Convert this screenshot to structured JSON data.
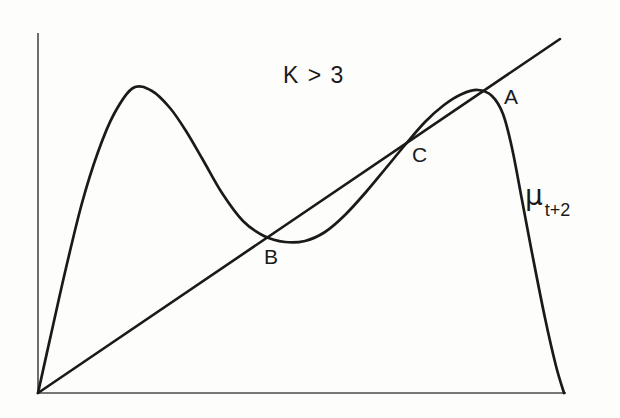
{
  "figure": {
    "background_color": "#fdfdfb",
    "ink_color": "#1a1a1a",
    "annotations": {
      "condition_label": "K > 3",
      "curve_label_symbol": "μ",
      "curve_label_subscript": "t+2",
      "point_a": "A",
      "point_b": "B",
      "point_c": "C"
    }
  },
  "chart_data": {
    "type": "line",
    "title": "K > 3",
    "xlabel": "",
    "ylabel": "",
    "grid": false,
    "legend": "none",
    "axes": {
      "style": "bare-L-axes",
      "x_ticks": [],
      "y_ticks": [],
      "xlim": [
        0,
        1
      ],
      "ylim": [
        0,
        1
      ],
      "origin_px": [
        38,
        393
      ],
      "x_axis_end_px": [
        566,
        393
      ],
      "y_axis_top_px": [
        38,
        33
      ]
    },
    "series": [
      {
        "name": "μ_{t+2}",
        "type": "curve",
        "description": "second-iterate logistic map: rises steeply from origin to a left peak, falls to an interior minimum, rises to a right peak, then plunges to the x-axis at the right edge",
        "points_px": [
          [
            38,
            393
          ],
          [
            52,
            330
          ],
          [
            66,
            268
          ],
          [
            82,
            203
          ],
          [
            98,
            152
          ],
          [
            114,
            114
          ],
          [
            133,
            88
          ],
          [
            152,
            91
          ],
          [
            170,
            108
          ],
          [
            186,
            131
          ],
          [
            203,
            160
          ],
          [
            222,
            193
          ],
          [
            243,
            221
          ],
          [
            264,
            236
          ],
          [
            285,
            242
          ],
          [
            305,
            241
          ],
          [
            325,
            232
          ],
          [
            345,
            215
          ],
          [
            366,
            192
          ],
          [
            386,
            168
          ],
          [
            405,
            145
          ],
          [
            425,
            122
          ],
          [
            444,
            105
          ],
          [
            462,
            94
          ],
          [
            478,
            90
          ],
          [
            492,
            96
          ],
          [
            503,
            114
          ],
          [
            512,
            148
          ],
          [
            522,
            200
          ],
          [
            533,
            258
          ],
          [
            545,
            318
          ],
          [
            556,
            366
          ],
          [
            564,
            393
          ]
        ],
        "features": {
          "left_peak_px": [
            133,
            88
          ],
          "interior_minimum_px": [
            293,
            242
          ],
          "right_peak_px": [
            478,
            90
          ],
          "right_endpoint_px": [
            564,
            393
          ]
        }
      },
      {
        "name": "45-degree diagonal",
        "type": "line",
        "description": "identity line mu_{t+2} = mu_t drawn from the origin toward the upper right",
        "points_px": [
          [
            38,
            393
          ],
          [
            560,
            39
          ]
        ]
      }
    ],
    "annotations": [
      {
        "text": "K > 3",
        "position_px": [
          296,
          77
        ],
        "role": "parameter-condition"
      },
      {
        "text": "A",
        "position_px": [
          510,
          98
        ],
        "role": "fixed-point-label",
        "marks_px": [
          481,
          92
        ]
      },
      {
        "text": "B",
        "position_px": [
          270,
          258
        ],
        "role": "fixed-point-label",
        "marks_px": [
          271,
          233
        ]
      },
      {
        "text": "C",
        "position_px": [
          418,
          156
        ],
        "role": "fixed-point-label",
        "marks_px": [
          405,
          145
        ]
      },
      {
        "text": "μ t+2",
        "position_px": [
          528,
          186
        ],
        "role": "curve-label"
      }
    ]
  }
}
